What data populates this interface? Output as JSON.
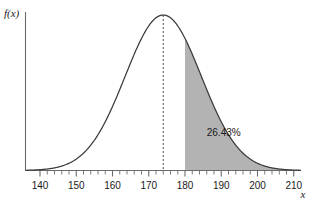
{
  "chart_data": {
    "type": "area",
    "title": "",
    "subtitle": "",
    "xlabel": "x",
    "ylabel": "f(x)",
    "xlim": [
      136,
      212
    ],
    "ylim": [
      0,
      1.06
    ],
    "grid": false,
    "legend": null,
    "distribution": {
      "kind": "normal",
      "mean": 174,
      "sd": 10.5
    },
    "x_ticks_major": [
      140,
      150,
      160,
      170,
      180,
      190,
      200,
      210
    ],
    "x_tick_labels": [
      "140",
      "150",
      "160",
      "170",
      "180",
      "190",
      "200",
      "210"
    ],
    "x_minor_tick_step": 2,
    "y_ticks_major": [],
    "y_tick_labels": [],
    "shaded_region": {
      "from": 180,
      "to": 212,
      "label": "26.43%",
      "label_x": 186,
      "label_y": 0.22,
      "fill_color": "#b3b3b3"
    },
    "mean_line": {
      "x": 174,
      "style": "dashed"
    },
    "curve_color": "#3a3a3a",
    "axis_color": "#6b6b6b"
  }
}
